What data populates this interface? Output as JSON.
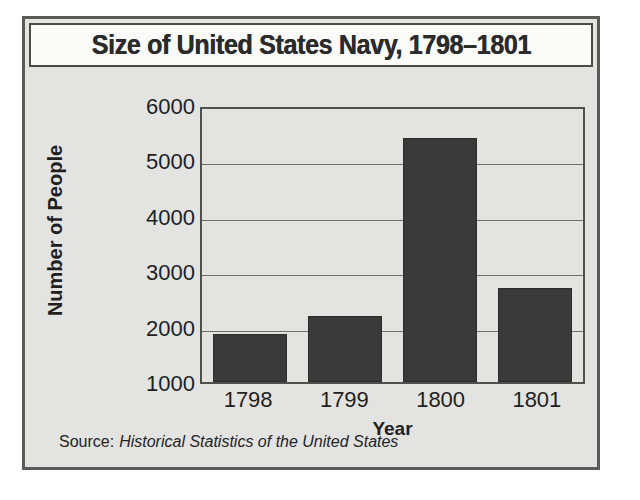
{
  "chart_data": {
    "type": "bar",
    "title": "Size of United States Navy, 1798–1801",
    "categories": [
      "1798",
      "1799",
      "1800",
      "1801"
    ],
    "values": [
      1870,
      2200,
      5400,
      2700
    ],
    "xlabel": "Year",
    "ylabel": "Number of People",
    "ylim": [
      1000,
      6000
    ],
    "yticks": [
      "6000",
      "5000",
      "4000",
      "3000",
      "2000",
      "1000"
    ],
    "ytick_values": [
      6000,
      5000,
      4000,
      3000,
      2000,
      1000
    ],
    "grid": true,
    "legend": false,
    "bar_color": "#3a3a3a",
    "plot_background": "#e3e3e1",
    "frame_color": "#5a5a5a"
  },
  "source": {
    "label": "Source:",
    "work": "Historical Statistics of the United States"
  }
}
